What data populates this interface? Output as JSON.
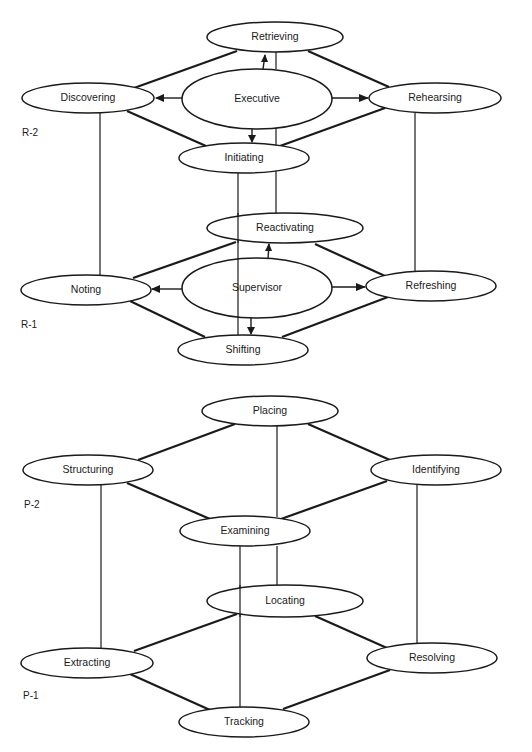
{
  "retrieval_diagram": {
    "levels": [
      {
        "id": "R-2",
        "label": "R-2"
      },
      {
        "id": "R-1",
        "label": "R-1"
      }
    ],
    "nodes": {
      "retrieving": "Retrieving",
      "discovering": "Discovering",
      "executive": "Executive",
      "rehearsing": "Rehearsing",
      "initiating": "Initiating",
      "reactivating": "Reactivating",
      "noting": "Noting",
      "supervisor": "Supervisor",
      "refreshing": "Refreshing",
      "shifting": "Shifting"
    },
    "edges": [
      [
        "Retrieving",
        "Discovering"
      ],
      [
        "Retrieving",
        "Rehearsing"
      ],
      [
        "Discovering",
        "Initiating"
      ],
      [
        "Rehearsing",
        "Initiating"
      ],
      [
        "Reactivating",
        "Noting"
      ],
      [
        "Reactivating",
        "Refreshing"
      ],
      [
        "Noting",
        "Shifting"
      ],
      [
        "Refreshing",
        "Shifting"
      ],
      [
        "Discovering",
        "Noting"
      ],
      [
        "Rehearsing",
        "Refreshing"
      ],
      [
        "Retrieving",
        "Reactivating"
      ],
      [
        "Initiating",
        "Shifting"
      ]
    ],
    "arrows": [
      [
        "Executive",
        "Retrieving"
      ],
      [
        "Executive",
        "Discovering"
      ],
      [
        "Executive",
        "Rehearsing"
      ],
      [
        "Executive",
        "Initiating"
      ],
      [
        "Supervisor",
        "Reactivating"
      ],
      [
        "Supervisor",
        "Noting"
      ],
      [
        "Supervisor",
        "Refreshing"
      ],
      [
        "Supervisor",
        "Shifting"
      ]
    ]
  },
  "perception_diagram": {
    "levels": [
      {
        "id": "P-2",
        "label": "P-2"
      },
      {
        "id": "P-1",
        "label": "P-1"
      }
    ],
    "nodes": {
      "placing": "Placing",
      "structuring": "Structuring",
      "identifying": "Identifying",
      "examining": "Examining",
      "locating": "Locating",
      "extracting": "Extracting",
      "resolving": "Resolving",
      "tracking": "Tracking"
    },
    "edges": [
      [
        "Placing",
        "Structuring"
      ],
      [
        "Placing",
        "Identifying"
      ],
      [
        "Structuring",
        "Examining"
      ],
      [
        "Identifying",
        "Examining"
      ],
      [
        "Placing",
        "Examining"
      ],
      [
        "Locating",
        "Extracting"
      ],
      [
        "Locating",
        "Resolving"
      ],
      [
        "Extracting",
        "Tracking"
      ],
      [
        "Resolving",
        "Tracking"
      ],
      [
        "Structuring",
        "Extracting"
      ],
      [
        "Identifying",
        "Resolving"
      ],
      [
        "Examining",
        "Locating"
      ],
      [
        "Examining",
        "Tracking"
      ]
    ]
  }
}
